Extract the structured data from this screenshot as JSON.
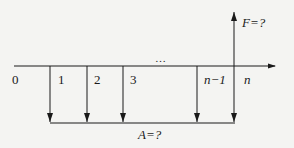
{
  "diagram": {
    "type": "cash-flow-diagram",
    "axis": {
      "origin_label": "0",
      "period_labels": [
        "1",
        "2",
        "3",
        "n−1",
        "n"
      ],
      "ellipsis": "…"
    },
    "future_value": {
      "label": "F=?",
      "direction": "up",
      "at_period": "n"
    },
    "annuity": {
      "label": "A=?",
      "direction": "down",
      "periods": [
        "1",
        "2",
        "3",
        "n−1",
        "n"
      ]
    },
    "colors": {
      "line": "#1a1a1a",
      "background": "#f4f4f2"
    }
  }
}
